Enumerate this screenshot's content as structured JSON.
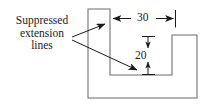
{
  "figure": {
    "type": "engineering-drawing",
    "line_color": "#5a5a5a",
    "text_color": "#1a1a1a",
    "background": "#ffffff"
  },
  "annotation": {
    "line1": "Suppressed",
    "line2": "extension",
    "line3": "lines"
  },
  "dimensions": {
    "horizontal": {
      "value": "30",
      "orientation": "horizontal",
      "arrow_style": "outward"
    },
    "vertical": {
      "value": "20",
      "orientation": "vertical",
      "arrow_style": "inward"
    }
  },
  "part_outline": {
    "points": "88,9 110,9 110,75 172,75 172,35 197,35 197,98 88,98",
    "closed": true
  },
  "leaders": [
    {
      "name": "leader-upper",
      "from": "72,36",
      "to": "107,23"
    },
    {
      "name": "leader-lower",
      "from": "72,40",
      "to": "140,72"
    }
  ]
}
